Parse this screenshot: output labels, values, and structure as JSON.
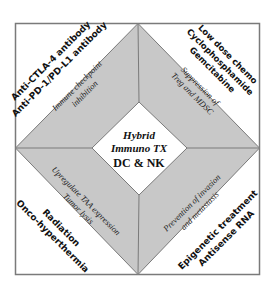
{
  "diagram": {
    "colors": {
      "frame": "#7a7a7a",
      "band": "#c8c8c8",
      "white": "#ffffff",
      "text": "#111111"
    },
    "center": {
      "line1": "Hybrid",
      "line2": "Immuno TX",
      "line3": "DC & NK"
    },
    "bands": {
      "top_left": {
        "line1": "Immune checkpoint",
        "line2": "inhibition"
      },
      "top_right": {
        "line1": "Suppression of",
        "line2": "Treg and MDSC"
      },
      "bottom_left": {
        "line1": "Upregulate TAA expression",
        "line2": "Tumor lysis"
      },
      "bottom_right": {
        "line1": "Prevention of invasion",
        "line2": "and metastasis"
      }
    },
    "corners": {
      "top_left": {
        "line1": "Anti-CTLA-4 antibody",
        "line2": "Anti-PD-1/PD-L1 antibody"
      },
      "top_right": {
        "line1": "Low dose chemo",
        "line2": "Cyclophosphamide",
        "line3": "Gemcitabine"
      },
      "bottom_left": {
        "line1": "Radiation",
        "line2": "Onco-hyperthermia"
      },
      "bottom_right": {
        "line1": "Epigenetic treatment",
        "line2": "Antisense RNA"
      }
    }
  }
}
